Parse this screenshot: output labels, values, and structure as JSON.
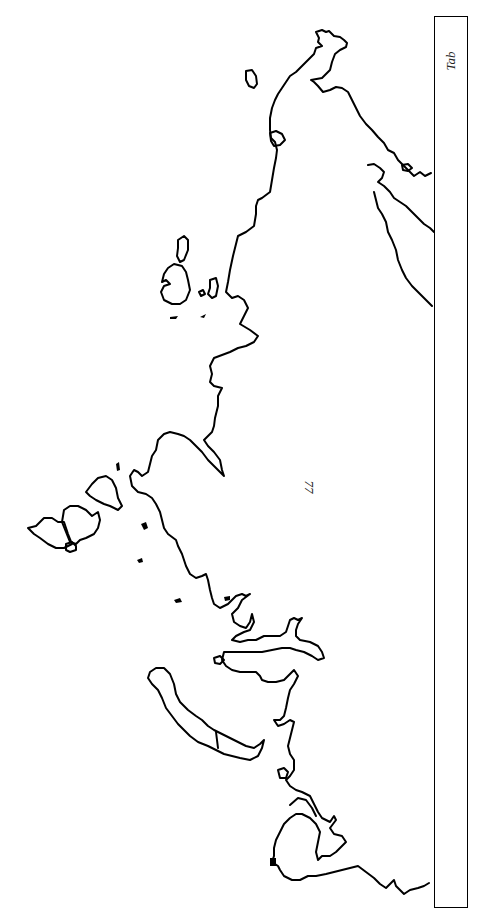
{
  "map": {
    "type": "outline coastline map",
    "orientation": "rotated 90 degrees",
    "stroke_color": "#000000",
    "background_color": "#ffffff"
  },
  "labels": {
    "region_number": "77",
    "tab_label": "Tab"
  }
}
